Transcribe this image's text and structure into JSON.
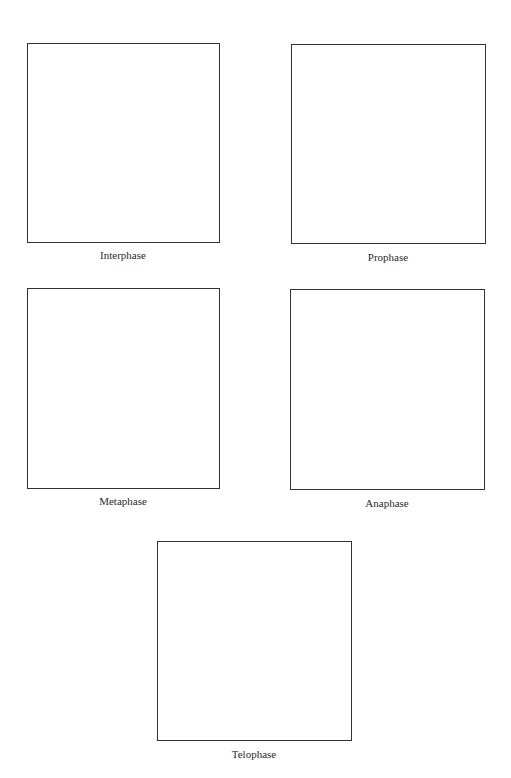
{
  "worksheet": {
    "panels": [
      {
        "id": "interphase",
        "label": "Interphase"
      },
      {
        "id": "prophase",
        "label": "Prophase"
      },
      {
        "id": "metaphase",
        "label": "Metaphase"
      },
      {
        "id": "anaphase",
        "label": "Anaphase"
      },
      {
        "id": "telophase",
        "label": "Telophase"
      }
    ]
  }
}
